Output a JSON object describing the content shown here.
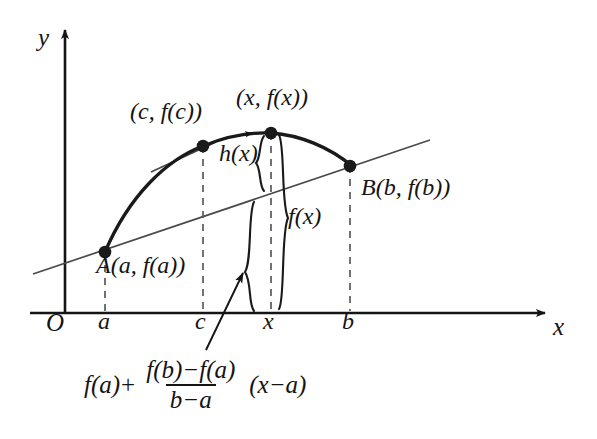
{
  "figure": {
    "type": "diagram",
    "axes": {
      "y_label": "y",
      "x_label": "x",
      "origin_label": "O"
    },
    "x_ticks": [
      {
        "id": "a",
        "label": "a",
        "px": 105
      },
      {
        "id": "c",
        "label": "c",
        "px": 203
      },
      {
        "id": "x",
        "label": "x",
        "px": 271
      },
      {
        "id": "b",
        "label": "b",
        "px": 350
      }
    ],
    "points": [
      {
        "id": "A",
        "label": "A(a, f(a))",
        "x": 105,
        "y": 252
      },
      {
        "id": "C",
        "label": "(c, f(c))",
        "x": 203,
        "y": 146
      },
      {
        "id": "X",
        "label": "(x, f(x))",
        "x": 271,
        "y": 133
      },
      {
        "id": "B",
        "label": "B(b, f(b))",
        "x": 350,
        "y": 166
      }
    ],
    "braces": [
      {
        "id": "h",
        "label": "h(x)",
        "meaning": "vertical gap between curve and secant line at x"
      },
      {
        "id": "f",
        "label": "f(x)",
        "meaning": "height of curve above x-axis at x"
      }
    ],
    "formula": {
      "lead": "f(a)",
      "operator": "+",
      "numerator": "f(b)−f(a)",
      "denominator": "b−a",
      "trailing": "(x−a)"
    },
    "elements": {
      "curve": "concave-down arc through A, C, X, B",
      "secant": "straight line through A and B, extended both ends",
      "tangent": "short tangent segment touching the curve at C",
      "pointer_arrow": "arrow from formula up to the secant line at x",
      "curve_arrow": "small arrowhead on curve left of point X"
    },
    "colors": {
      "ink": "#141414",
      "curve": "#1a1a1a",
      "thin_line": "#4a4a4a",
      "dashed": "#5a5a5a",
      "background": "#ffffff"
    }
  }
}
